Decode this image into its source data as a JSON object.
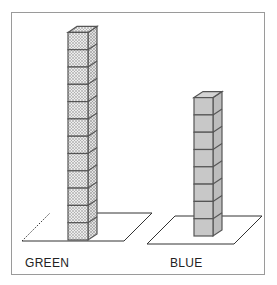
{
  "diagram": {
    "towers": [
      {
        "label": "GREEN",
        "cube_count": 12,
        "fill": "#d6d6d6",
        "pattern": "dotted",
        "stroke": "#555555",
        "base_left_edge": "dashed"
      },
      {
        "label": "BLUE",
        "cube_count": 8,
        "fill": "#c8c8c8",
        "pattern": "solid",
        "stroke": "#555555",
        "base_left_edge": "solid"
      }
    ],
    "frame_color": "#9a9a9a"
  }
}
